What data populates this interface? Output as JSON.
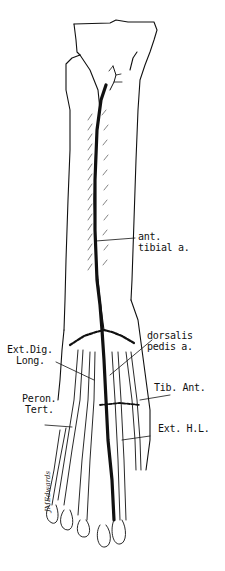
{
  "figure": {
    "type": "anatomical line drawing",
    "line_color": "#111111",
    "background": "#ffffff"
  },
  "labels": {
    "ant_tibial": {
      "line1": "ant.",
      "line2": "tibial a."
    },
    "dorsalis_pedis": {
      "line1": "dorsalis",
      "line2": "pedis a."
    },
    "ext_dig_long": {
      "line1": "Ext.Dig.",
      "line2": "Long."
    },
    "tib_ant": {
      "line1": "Tib. Ant."
    },
    "peron_tert": {
      "line1": "Peron.",
      "line2": "Tert."
    },
    "ext_hl": {
      "line1": "Ext. H.L."
    }
  },
  "signature": "JMEdwards"
}
